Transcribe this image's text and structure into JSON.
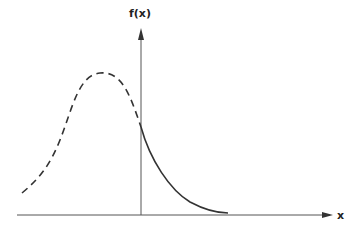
{
  "diagram": {
    "y_axis_label": "f(x)",
    "x_axis_label": "x",
    "colors": {
      "line": "#333333",
      "axis": "#555555"
    },
    "curves": [
      {
        "name": "dashed-hypothetical-curve",
        "style": "dashed",
        "description": "bell-shaped curve, left of vertical axis"
      },
      {
        "name": "solid-decay-curve",
        "style": "solid",
        "description": "decaying curve, right of vertical axis"
      }
    ]
  }
}
